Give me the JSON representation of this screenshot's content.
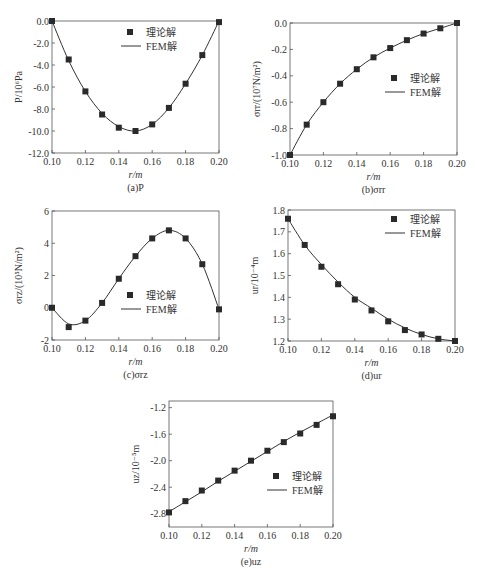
{
  "chart_data": [
    {
      "id": "a",
      "type": "line",
      "caption": "(a)P",
      "title": "",
      "xlabel": "r/m",
      "ylabel": "P/10⁶Pa",
      "xlim": [
        0.1,
        0.2
      ],
      "ylim": [
        -12.0,
        0.0
      ],
      "xticks": [
        "0.10",
        "0.12",
        "0.14",
        "0.16",
        "0.18",
        "0.20"
      ],
      "yticks": [
        "0.0",
        "-2.0",
        "-4.0",
        "-6.0",
        "-8.0",
        "-10.0",
        "-12.0"
      ],
      "grid": false,
      "legend": {
        "position": "upper right",
        "entries": [
          "理论解",
          "FEM解"
        ]
      },
      "x": [
        0.1,
        0.11,
        0.12,
        0.13,
        0.14,
        0.15,
        0.16,
        0.17,
        0.18,
        0.19,
        0.2
      ],
      "series": [
        {
          "name": "理论解",
          "style": "marker-square",
          "values": [
            0.0,
            -3.5,
            -6.4,
            -8.5,
            -9.7,
            -10.0,
            -9.4,
            -7.9,
            -5.7,
            -3.1,
            -0.1
          ]
        },
        {
          "name": "FEM解",
          "style": "line",
          "values": [
            0.0,
            -3.6,
            -6.4,
            -8.4,
            -9.6,
            -10.0,
            -9.4,
            -7.9,
            -5.7,
            -3.1,
            0.0
          ]
        }
      ],
      "frame": {
        "x0": 52,
        "x1": 219,
        "y0": 21,
        "y1": 153
      },
      "legend_pos": {
        "x": 130,
        "y": 32
      }
    },
    {
      "id": "b",
      "type": "line",
      "caption": "(b)σrr",
      "title": "",
      "xlabel": "r/m",
      "ylabel": "σrr/(10⁷N/m²)",
      "xlim": [
        0.1,
        0.2
      ],
      "ylim": [
        -1.0,
        0.0
      ],
      "xticks": [
        "0.10",
        "0.12",
        "0.14",
        "0.16",
        "0.18",
        "0.20"
      ],
      "yticks": [
        "0.0",
        "-0.2",
        "-0.4",
        "-0.6",
        "-0.8",
        "-1.0"
      ],
      "grid": false,
      "legend": {
        "position": "center right",
        "entries": [
          "理论解",
          "FEM解"
        ]
      },
      "x": [
        0.1,
        0.11,
        0.12,
        0.13,
        0.14,
        0.15,
        0.16,
        0.17,
        0.18,
        0.19,
        0.2
      ],
      "series": [
        {
          "name": "理论解",
          "style": "marker-square",
          "values": [
            -1.0,
            -0.77,
            -0.6,
            -0.46,
            -0.35,
            -0.26,
            -0.19,
            -0.13,
            -0.08,
            -0.04,
            0.0
          ]
        },
        {
          "name": "FEM解",
          "style": "line",
          "values": [
            -1.0,
            -0.77,
            -0.6,
            -0.46,
            -0.35,
            -0.26,
            -0.19,
            -0.13,
            -0.08,
            -0.04,
            0.0
          ]
        }
      ],
      "frame": {
        "x0": 290,
        "x1": 457,
        "y0": 23,
        "y1": 155
      },
      "legend_pos": {
        "x": 394,
        "y": 78
      }
    },
    {
      "id": "c",
      "type": "line",
      "caption": "(c)σrz",
      "title": "",
      "xlabel": "r/m",
      "ylabel": "σrz/(10⁵N/m²)",
      "xlim": [
        0.1,
        0.2
      ],
      "ylim": [
        -2,
        6
      ],
      "xticks": [
        "0.10",
        "0.12",
        "0.14",
        "0.16",
        "0.18",
        "0.20"
      ],
      "yticks": [
        "6",
        "4",
        "2",
        "0",
        "-2"
      ],
      "grid": false,
      "legend": {
        "position": "lower right",
        "entries": [
          "理论解",
          "FEM解"
        ]
      },
      "x": [
        0.1,
        0.11,
        0.12,
        0.13,
        0.14,
        0.15,
        0.16,
        0.17,
        0.18,
        0.19,
        0.2
      ],
      "series": [
        {
          "name": "理论解",
          "style": "marker-square",
          "values": [
            0.0,
            -1.2,
            -0.8,
            0.3,
            1.8,
            3.2,
            4.3,
            4.8,
            4.3,
            2.7,
            -0.1
          ]
        },
        {
          "name": "FEM解",
          "style": "line",
          "values": [
            0.0,
            -1.0,
            -0.8,
            0.3,
            1.8,
            3.2,
            4.3,
            4.8,
            4.3,
            2.7,
            -0.1
          ]
        }
      ],
      "frame": {
        "x0": 52,
        "x1": 219,
        "y0": 211,
        "y1": 340
      },
      "legend_pos": {
        "x": 130,
        "y": 295
      }
    },
    {
      "id": "d",
      "type": "line",
      "caption": "(d)ur",
      "title": "",
      "xlabel": "r/m",
      "ylabel": "ur/10⁻⁴m",
      "xlim": [
        0.1,
        0.2
      ],
      "ylim": [
        1.2,
        1.8
      ],
      "xticks": [
        "0.10",
        "0.12",
        "0.14",
        "0.16",
        "0.18",
        "0.20"
      ],
      "yticks": [
        "1.8",
        "1.7",
        "1.6",
        "1.5",
        "1.4",
        "1.3",
        "1.2"
      ],
      "grid": false,
      "legend": {
        "position": "upper right",
        "entries": [
          "理论解",
          "FEM解"
        ]
      },
      "x": [
        0.1,
        0.11,
        0.12,
        0.13,
        0.14,
        0.15,
        0.16,
        0.17,
        0.18,
        0.19,
        0.2
      ],
      "series": [
        {
          "name": "理论解",
          "style": "marker-square",
          "values": [
            1.76,
            1.64,
            1.54,
            1.46,
            1.39,
            1.34,
            1.29,
            1.25,
            1.23,
            1.21,
            1.2
          ]
        },
        {
          "name": "FEM解",
          "style": "line",
          "values": [
            1.76,
            1.64,
            1.55,
            1.47,
            1.4,
            1.35,
            1.3,
            1.26,
            1.23,
            1.21,
            1.2
          ]
        }
      ],
      "frame": {
        "x0": 288,
        "x1": 455,
        "y0": 210,
        "y1": 341
      },
      "legend_pos": {
        "x": 394,
        "y": 219
      }
    },
    {
      "id": "e",
      "type": "line",
      "caption": "(e)uz",
      "title": "",
      "xlabel": "r/m",
      "ylabel": "uz/10⁻⁵m",
      "xlim": [
        0.1,
        0.2
      ],
      "ylim": [
        -3.0,
        -1.1
      ],
      "xticks": [
        "0.10",
        "0.12",
        "0.14",
        "0.16",
        "0.18",
        "0.20"
      ],
      "yticks": [
        "-1.2",
        "-1.6",
        "-2.0",
        "-2.4",
        "-2.8"
      ],
      "grid": false,
      "legend": {
        "position": "center right",
        "entries": [
          "理论解",
          "FEM解"
        ]
      },
      "x": [
        0.1,
        0.11,
        0.12,
        0.13,
        0.14,
        0.15,
        0.16,
        0.17,
        0.18,
        0.19,
        0.2
      ],
      "series": [
        {
          "name": "理论解",
          "style": "marker-square",
          "values": [
            -2.78,
            -2.61,
            -2.45,
            -2.3,
            -2.15,
            -2.0,
            -1.85,
            -1.72,
            -1.59,
            -1.46,
            -1.33
          ]
        },
        {
          "name": "FEM解",
          "style": "line",
          "values": [
            -2.77,
            -2.62,
            -2.47,
            -2.31,
            -2.16,
            -2.01,
            -1.86,
            -1.71,
            -1.57,
            -1.44,
            -1.31
          ]
        }
      ],
      "frame": {
        "x0": 169,
        "x1": 333,
        "y0": 401,
        "y1": 527
      },
      "legend_pos": {
        "x": 276,
        "y": 476
      }
    }
  ]
}
